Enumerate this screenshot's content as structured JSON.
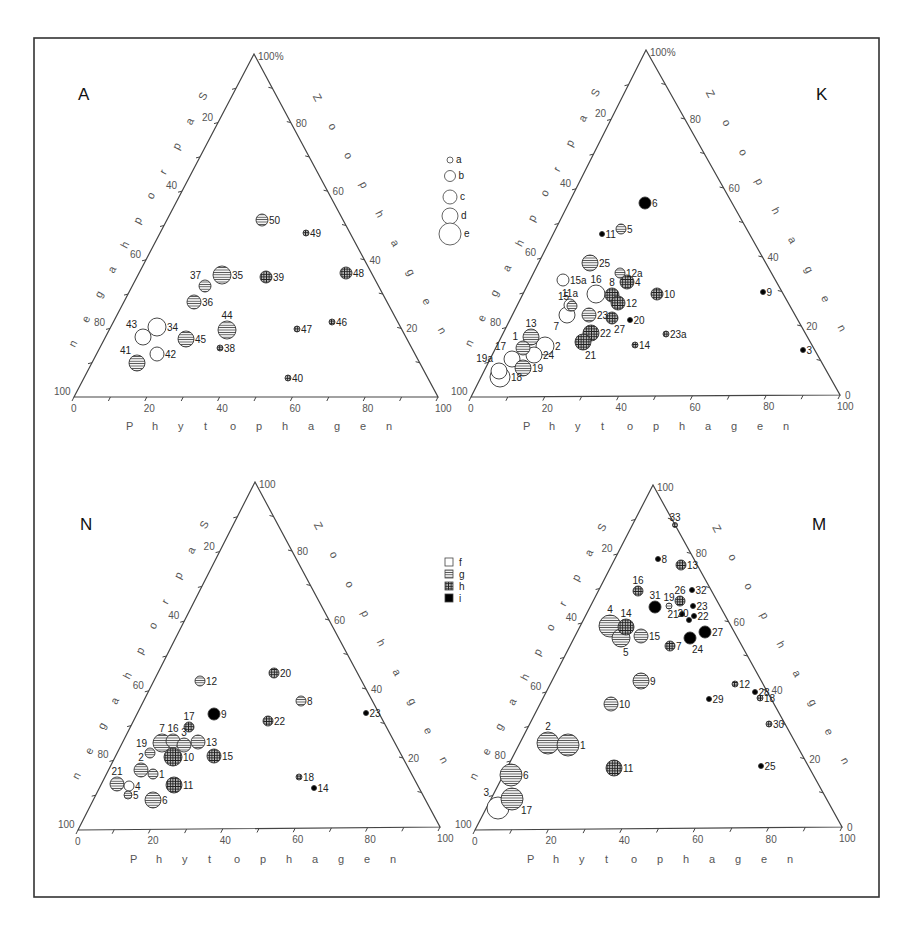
{
  "chart_data": [
    {
      "type": "scatter",
      "subtype": "ternary",
      "panel": "A",
      "title": "A",
      "axes": {
        "left": "Saprophagen",
        "right": "Zoophagen",
        "bottom": "Phytophagen"
      },
      "ticks": {
        "left": [
          "20",
          "40",
          "60",
          "80",
          "100"
        ],
        "right": [
          "100%",
          "80",
          "60",
          "40",
          "20"
        ],
        "bottom": [
          "0",
          "20",
          "40",
          "60",
          "80",
          "100"
        ]
      },
      "points": [
        {
          "label": "50",
          "x": 262,
          "y": 220,
          "r": 6,
          "fill": "g",
          "lx": "r"
        },
        {
          "label": "49",
          "x": 306,
          "y": 233,
          "r": 3,
          "fill": "h",
          "lx": "r"
        },
        {
          "label": "37",
          "x": 205,
          "y": 286,
          "r": 6,
          "fill": "g",
          "lx": "tl"
        },
        {
          "label": "35",
          "x": 222,
          "y": 275,
          "r": 9,
          "fill": "g",
          "lx": "r"
        },
        {
          "label": "39",
          "x": 266,
          "y": 277,
          "r": 6,
          "fill": "h",
          "lx": "r"
        },
        {
          "label": "48",
          "x": 346,
          "y": 273,
          "r": 6,
          "fill": "h",
          "lx": "r"
        },
        {
          "label": "36",
          "x": 194,
          "y": 302,
          "r": 7,
          "fill": "g",
          "lx": "r"
        },
        {
          "label": "44",
          "x": 227,
          "y": 330,
          "r": 9,
          "fill": "g",
          "lx": "t"
        },
        {
          "label": "46",
          "x": 332,
          "y": 322,
          "r": 3,
          "fill": "h",
          "lx": "r"
        },
        {
          "label": "47",
          "x": 297,
          "y": 329,
          "r": 3,
          "fill": "h",
          "lx": "r"
        },
        {
          "label": "43",
          "x": 143,
          "y": 337,
          "r": 8,
          "fill": "f",
          "lx": "tl"
        },
        {
          "label": "34",
          "x": 157,
          "y": 327,
          "r": 9,
          "fill": "f",
          "lx": "r"
        },
        {
          "label": "45",
          "x": 186,
          "y": 339,
          "r": 8,
          "fill": "g",
          "lx": "r"
        },
        {
          "label": "38",
          "x": 220,
          "y": 348,
          "r": 3,
          "fill": "h",
          "lx": "r"
        },
        {
          "label": "42",
          "x": 157,
          "y": 354,
          "r": 7,
          "fill": "f",
          "lx": "r"
        },
        {
          "label": "41",
          "x": 137,
          "y": 363,
          "r": 8,
          "fill": "g",
          "lx": "tl"
        },
        {
          "label": "40",
          "x": 288,
          "y": 378,
          "r": 3,
          "fill": "h",
          "lx": "r"
        }
      ]
    },
    {
      "type": "scatter",
      "subtype": "ternary",
      "panel": "K",
      "title": "K",
      "axes": {
        "left": "Saprophagen",
        "right": "Zoophagen",
        "bottom": "Phytophagen"
      },
      "ticks": {
        "left": [
          "20",
          "40",
          "60",
          "80",
          "100"
        ],
        "right": [
          "100%",
          "80",
          "60",
          "40",
          "20",
          "0"
        ],
        "bottom": [
          "0",
          "20",
          "40",
          "60",
          "80",
          "100"
        ]
      },
      "points": [
        {
          "label": "6",
          "x": 645,
          "y": 203,
          "r": 6,
          "fill": "i",
          "lx": "r"
        },
        {
          "label": "5",
          "x": 621,
          "y": 229,
          "r": 5,
          "fill": "g",
          "lx": "r"
        },
        {
          "label": "11",
          "x": 602,
          "y": 234,
          "r": 2.5,
          "fill": "i",
          "lx": "r"
        },
        {
          "label": "25",
          "x": 590,
          "y": 263,
          "r": 8,
          "fill": "g",
          "lx": "r"
        },
        {
          "label": "12a",
          "x": 620,
          "y": 273,
          "r": 5,
          "fill": "g",
          "lx": "r"
        },
        {
          "label": "4",
          "x": 627,
          "y": 282,
          "r": 7,
          "fill": "h",
          "lx": "r"
        },
        {
          "label": "15a",
          "x": 563,
          "y": 280,
          "r": 6,
          "fill": "f",
          "lx": "r"
        },
        {
          "label": "16",
          "x": 596,
          "y": 294,
          "r": 9,
          "fill": "f",
          "lx": "t"
        },
        {
          "label": "8",
          "x": 612,
          "y": 295,
          "r": 7,
          "fill": "h",
          "lx": "t"
        },
        {
          "label": "10",
          "x": 657,
          "y": 294,
          "r": 6,
          "fill": "h",
          "lx": "r"
        },
        {
          "label": "11a",
          "x": 570,
          "y": 305,
          "r": 6,
          "fill": "f",
          "lx": "t"
        },
        {
          "label": "12",
          "x": 618,
          "y": 303,
          "r": 7,
          "fill": "h",
          "lx": "r"
        },
        {
          "label": "15",
          "x": 572,
          "y": 306,
          "r": 5,
          "fill": "g",
          "lx": "tl"
        },
        {
          "label": "7",
          "x": 567,
          "y": 315,
          "r": 8,
          "fill": "f",
          "lx": "bl"
        },
        {
          "label": "23",
          "x": 589,
          "y": 315,
          "r": 7,
          "fill": "g",
          "lx": "r"
        },
        {
          "label": "27",
          "x": 612,
          "y": 318,
          "r": 6,
          "fill": "h",
          "lx": "b"
        },
        {
          "label": "20",
          "x": 630,
          "y": 320,
          "r": 2.5,
          "fill": "i",
          "lx": "r"
        },
        {
          "label": "13",
          "x": 531,
          "y": 337,
          "r": 8,
          "fill": "g",
          "lx": "t"
        },
        {
          "label": "22",
          "x": 591,
          "y": 333,
          "r": 8,
          "fill": "h",
          "lx": "r"
        },
        {
          "label": "21",
          "x": 583,
          "y": 342,
          "r": 8,
          "fill": "h",
          "lx": "b"
        },
        {
          "label": "23a",
          "x": 666,
          "y": 334,
          "r": 3,
          "fill": "h",
          "lx": "r"
        },
        {
          "label": "1",
          "x": 523,
          "y": 348,
          "r": 7,
          "fill": "g",
          "lx": "tl"
        },
        {
          "label": "2",
          "x": 545,
          "y": 346,
          "r": 9,
          "fill": "f",
          "lx": "r"
        },
        {
          "label": "14",
          "x": 635,
          "y": 345,
          "r": 3,
          "fill": "h",
          "lx": "r"
        },
        {
          "label": "17",
          "x": 512,
          "y": 359,
          "r": 8,
          "fill": "f",
          "lx": "tl"
        },
        {
          "label": "24",
          "x": 534,
          "y": 355,
          "r": 8,
          "fill": "f",
          "lx": "r"
        },
        {
          "label": "19",
          "x": 523,
          "y": 368,
          "r": 8,
          "fill": "g",
          "lx": "r"
        },
        {
          "label": "19a",
          "x": 499,
          "y": 371,
          "r": 8,
          "fill": "f",
          "lx": "tl"
        },
        {
          "label": "18",
          "x": 500,
          "y": 377,
          "r": 10,
          "fill": "f",
          "lx": "r"
        },
        {
          "label": "9",
          "x": 763,
          "y": 292,
          "r": 2.5,
          "fill": "i",
          "lx": "r"
        },
        {
          "label": "3",
          "x": 803,
          "y": 350,
          "r": 2.5,
          "fill": "i",
          "lx": "r"
        }
      ]
    },
    {
      "type": "scatter",
      "subtype": "ternary",
      "panel": "N",
      "title": "N",
      "axes": {
        "left": "Saprophagen",
        "right": "Zoophagen",
        "bottom": "Phytophagen"
      },
      "ticks": {
        "left": [
          "20",
          "40",
          "60",
          "80",
          "100"
        ],
        "right": [
          "100",
          "80",
          "60",
          "40",
          "20"
        ],
        "bottom": [
          "0",
          "20",
          "40",
          "60",
          "80",
          "100"
        ]
      },
      "points": [
        {
          "label": "12",
          "x": 200,
          "y": 681,
          "r": 5,
          "fill": "g",
          "lx": "r"
        },
        {
          "label": "20",
          "x": 274,
          "y": 673,
          "r": 5,
          "fill": "h",
          "lx": "r"
        },
        {
          "label": "8",
          "x": 301,
          "y": 701,
          "r": 5,
          "fill": "g",
          "lx": "r"
        },
        {
          "label": "9",
          "x": 214,
          "y": 714,
          "r": 6,
          "fill": "i",
          "lx": "r"
        },
        {
          "label": "22",
          "x": 268,
          "y": 721,
          "r": 5,
          "fill": "h",
          "lx": "r"
        },
        {
          "label": "23",
          "x": 366,
          "y": 713,
          "r": 2.5,
          "fill": "i",
          "lx": "r"
        },
        {
          "label": "17",
          "x": 189,
          "y": 727,
          "r": 5,
          "fill": "h",
          "lx": "t"
        },
        {
          "label": "7",
          "x": 162,
          "y": 743,
          "r": 9,
          "fill": "g",
          "lx": "t"
        },
        {
          "label": "16",
          "x": 173,
          "y": 741,
          "r": 7,
          "fill": "g",
          "lx": "t"
        },
        {
          "label": "3",
          "x": 184,
          "y": 745,
          "r": 7,
          "fill": "g",
          "lx": "t"
        },
        {
          "label": "13",
          "x": 198,
          "y": 742,
          "r": 7,
          "fill": "g",
          "lx": "r"
        },
        {
          "label": "19",
          "x": 150,
          "y": 753,
          "r": 5,
          "fill": "g",
          "lx": "tl"
        },
        {
          "label": "10",
          "x": 173,
          "y": 757,
          "r": 9,
          "fill": "h",
          "lx": "r"
        },
        {
          "label": "15",
          "x": 214,
          "y": 756,
          "r": 7,
          "fill": "h",
          "lx": "r"
        },
        {
          "label": "2",
          "x": 141,
          "y": 770,
          "r": 7,
          "fill": "g",
          "lx": "t"
        },
        {
          "label": "1",
          "x": 153,
          "y": 774,
          "r": 5,
          "fill": "g",
          "lx": "r"
        },
        {
          "label": "21",
          "x": 117,
          "y": 784,
          "r": 7,
          "fill": "g",
          "lx": "t"
        },
        {
          "label": "4",
          "x": 129,
          "y": 786,
          "r": 5,
          "fill": "f",
          "lx": "r"
        },
        {
          "label": "11",
          "x": 174,
          "y": 785,
          "r": 8,
          "fill": "h",
          "lx": "r"
        },
        {
          "label": "5",
          "x": 128,
          "y": 795,
          "r": 4,
          "fill": "g",
          "lx": "r"
        },
        {
          "label": "6",
          "x": 153,
          "y": 800,
          "r": 8,
          "fill": "g",
          "lx": "r"
        },
        {
          "label": "18",
          "x": 299,
          "y": 777,
          "r": 3,
          "fill": "h",
          "lx": "r"
        },
        {
          "label": "14",
          "x": 314,
          "y": 788,
          "r": 2.5,
          "fill": "i",
          "lx": "r"
        }
      ]
    },
    {
      "type": "scatter",
      "subtype": "ternary",
      "panel": "M",
      "title": "M",
      "axes": {
        "left": "Saprophagen",
        "right": "Zoophagen",
        "bottom": "Phytophagen"
      },
      "ticks": {
        "left": [
          "20",
          "40",
          "60",
          "80",
          "100"
        ],
        "right": [
          "100",
          "80",
          "60",
          "40",
          "20",
          "0"
        ],
        "bottom": [
          "0",
          "20",
          "40",
          "60",
          "80",
          "100"
        ]
      },
      "points": [
        {
          "label": "33",
          "x": 675,
          "y": 525,
          "r": 2.5,
          "fill": "h",
          "lx": "t"
        },
        {
          "label": "8",
          "x": 658,
          "y": 559,
          "r": 2.5,
          "fill": "i",
          "lx": "r"
        },
        {
          "label": "13",
          "x": 681,
          "y": 565,
          "r": 5,
          "fill": "h",
          "lx": "r"
        },
        {
          "label": "16",
          "x": 638,
          "y": 591,
          "r": 5,
          "fill": "h",
          "lx": "t"
        },
        {
          "label": "26",
          "x": 680,
          "y": 601,
          "r": 5,
          "fill": "h",
          "lx": "t"
        },
        {
          "label": "32",
          "x": 692,
          "y": 590,
          "r": 2.5,
          "fill": "i",
          "lx": "r"
        },
        {
          "label": "19",
          "x": 669,
          "y": 606,
          "r": 3,
          "fill": "g",
          "lx": "t"
        },
        {
          "label": "31",
          "x": 655,
          "y": 607,
          "r": 6,
          "fill": "i",
          "lx": "t"
        },
        {
          "label": "23",
          "x": 693,
          "y": 606,
          "r": 2.5,
          "fill": "i",
          "lx": "r"
        },
        {
          "label": "21",
          "x": 682,
          "y": 614,
          "r": 2.5,
          "fill": "i",
          "lx": "l"
        },
        {
          "label": "22",
          "x": 694,
          "y": 616,
          "r": 2.5,
          "fill": "i",
          "lx": "r"
        },
        {
          "label": "20",
          "x": 689,
          "y": 620,
          "r": 2.5,
          "fill": "i",
          "lx": "tl"
        },
        {
          "label": "27",
          "x": 705,
          "y": 632,
          "r": 6,
          "fill": "i",
          "lx": "r"
        },
        {
          "label": "24",
          "x": 690,
          "y": 638,
          "r": 6,
          "fill": "i",
          "lx": "b"
        },
        {
          "label": "4",
          "x": 610,
          "y": 626,
          "r": 11,
          "fill": "g",
          "lx": "t"
        },
        {
          "label": "14",
          "x": 626,
          "y": 627,
          "r": 8,
          "fill": "h",
          "lx": "t"
        },
        {
          "label": "5",
          "x": 621,
          "y": 638,
          "r": 9,
          "fill": "g",
          "lx": "b"
        },
        {
          "label": "15",
          "x": 641,
          "y": 636,
          "r": 7,
          "fill": "g",
          "lx": "r"
        },
        {
          "label": "7",
          "x": 670,
          "y": 646,
          "r": 5,
          "fill": "h",
          "lx": "r"
        },
        {
          "label": "9",
          "x": 641,
          "y": 681,
          "r": 8,
          "fill": "g",
          "lx": "r"
        },
        {
          "label": "10",
          "x": 611,
          "y": 704,
          "r": 7,
          "fill": "g",
          "lx": "r"
        },
        {
          "label": "12",
          "x": 735,
          "y": 684,
          "r": 3,
          "fill": "h",
          "lx": "r"
        },
        {
          "label": "28",
          "x": 755,
          "y": 692,
          "r": 2.5,
          "fill": "i",
          "lx": "r"
        },
        {
          "label": "18",
          "x": 760,
          "y": 698,
          "r": 3,
          "fill": "h",
          "lx": "r"
        },
        {
          "label": "29",
          "x": 709,
          "y": 699,
          "r": 2.5,
          "fill": "i",
          "lx": "r"
        },
        {
          "label": "30",
          "x": 769,
          "y": 724,
          "r": 3,
          "fill": "h",
          "lx": "r"
        },
        {
          "label": "2",
          "x": 548,
          "y": 743,
          "r": 11,
          "fill": "g",
          "lx": "t"
        },
        {
          "label": "1",
          "x": 568,
          "y": 745,
          "r": 11,
          "fill": "g",
          "lx": "r"
        },
        {
          "label": "25",
          "x": 761,
          "y": 766,
          "r": 2.5,
          "fill": "i",
          "lx": "r"
        },
        {
          "label": "11",
          "x": 614,
          "y": 768,
          "r": 8,
          "fill": "h",
          "lx": "r"
        },
        {
          "label": "6",
          "x": 511,
          "y": 775,
          "r": 11,
          "fill": "g",
          "lx": "r"
        },
        {
          "label": "3",
          "x": 498,
          "y": 808,
          "r": 11,
          "fill": "f",
          "lx": "tl"
        },
        {
          "label": "17",
          "x": 512,
          "y": 799,
          "r": 11,
          "fill": "g",
          "lx": "br"
        }
      ]
    }
  ],
  "legend_size": {
    "items": [
      {
        "label": "a",
        "r": 3
      },
      {
        "label": "b",
        "r": 5.5
      },
      {
        "label": "c",
        "r": 7
      },
      {
        "label": "d",
        "r": 8
      },
      {
        "label": "e",
        "r": 11
      }
    ]
  },
  "legend_fill": {
    "items": [
      {
        "label": "f",
        "fill": "f"
      },
      {
        "label": "g",
        "fill": "g"
      },
      {
        "label": "h",
        "fill": "h"
      },
      {
        "label": "i",
        "fill": "i"
      }
    ]
  },
  "axis_labels": {
    "left": "Saprophagen",
    "right": "Zoophagen",
    "bottom": "Phytophagen"
  },
  "panel_letters": {
    "A": "A",
    "K": "K",
    "N": "N",
    "M": "M"
  },
  "colors": {
    "stroke": "#333333",
    "dark": "#111111",
    "frame": "#333333"
  }
}
